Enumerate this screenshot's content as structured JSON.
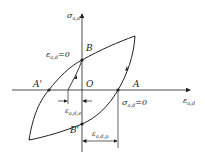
{
  "diagram": {
    "type": "hysteresis-loop",
    "axes": {
      "y_label": "σ",
      "y_sub": "a,d",
      "x_label": "ε",
      "x_sub": "a,d"
    },
    "points": {
      "A": "A",
      "A_prime": "A'",
      "B": "B",
      "B_prime": "B'",
      "O": "O"
    },
    "annotations": {
      "strain_zero": {
        "sym": "ε",
        "sub": "a,d",
        "rest": "=0"
      },
      "stress_zero": {
        "sym": "σ",
        "sub": "a,d",
        "rest": "=0"
      },
      "elastic_strain": {
        "sym": "ε",
        "sub": "a,d,e"
      },
      "plastic_strain": {
        "sym": "ε",
        "sub": "a,d,p"
      }
    },
    "colors": {
      "line": "#222222",
      "background": "#ffffff"
    }
  }
}
